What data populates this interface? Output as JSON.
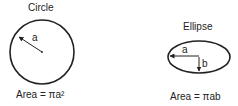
{
  "circle": {
    "title": "Circle",
    "radius_label": "a",
    "formula": "Area = πa²"
  },
  "ellipse": {
    "title": "Ellipse",
    "semi_major_label": "a",
    "semi_minor_label": "b",
    "formula": "Area = πab"
  }
}
